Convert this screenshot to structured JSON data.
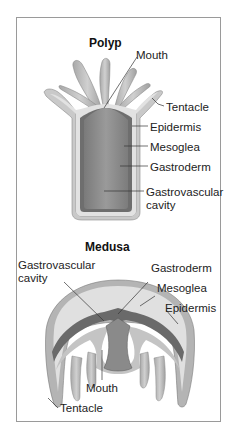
{
  "polyp": {
    "title": "Polyp",
    "labels": {
      "mouth": "Mouth",
      "tentacle": "Tentacle",
      "epidermis": "Epidermis",
      "mesoglea": "Mesoglea",
      "gastroderm": "Gastroderm",
      "cavity_line1": "Gastrovascular",
      "cavity_line2": "cavity"
    }
  },
  "medusa": {
    "title": "Medusa",
    "labels": {
      "cavity_line1": "Gastrovascular",
      "cavity_line2": "cavity",
      "gastroderm": "Gastroderm",
      "mesoglea": "Mesoglea",
      "epidermis": "Epidermis",
      "mouth": "Mouth",
      "tentacle": "Tentacle"
    }
  },
  "colors": {
    "frame": "#9a9a9a",
    "epidermis": "#c9c9c9",
    "mesoglea": "#dcdcdc",
    "gastroderm": "#6e6e6e",
    "cavity": "#8f8f8f",
    "leader": "#333333"
  }
}
